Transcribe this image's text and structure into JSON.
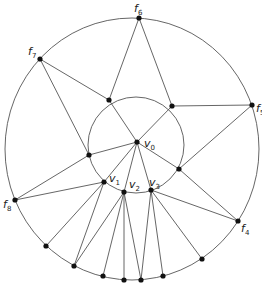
{
  "diagram": {
    "colors": {
      "stroke": "#555555",
      "point": "#111111",
      "background": "#ffffff"
    },
    "outer_circle": {
      "cx": 132,
      "cy": 149,
      "rx": 127,
      "ry": 131
    },
    "inner_circle": {
      "cx": 136,
      "cy": 145,
      "r": 48
    },
    "points": {
      "v0": [
        137,
        142
      ],
      "v1": [
        104,
        182
      ],
      "v2": [
        124,
        192
      ],
      "v3": [
        151,
        190
      ],
      "a1": [
        109,
        100
      ],
      "a2": [
        172,
        106
      ],
      "a3": [
        89,
        155
      ],
      "a4": [
        179,
        169
      ],
      "f4": [
        238,
        221
      ],
      "f5": [
        252,
        105
      ],
      "f6": [
        139,
        18
      ],
      "f7": [
        40,
        59
      ],
      "f8": [
        15,
        200
      ],
      "b1": [
        46,
        246
      ],
      "b2": [
        74,
        266
      ],
      "b3": [
        103,
        276
      ],
      "b4": [
        124,
        280
      ],
      "b5": [
        141,
        280
      ],
      "b6": [
        163,
        276
      ],
      "b7": [
        202,
        259
      ]
    },
    "edges": [
      [
        "f6",
        "a1"
      ],
      [
        "f6",
        "a2"
      ],
      [
        "f7",
        "a1"
      ],
      [
        "f7",
        "a3"
      ],
      [
        "a1",
        "v0"
      ],
      [
        "a2",
        "v0"
      ],
      [
        "a2",
        "f5"
      ],
      [
        "f5",
        "a4"
      ],
      [
        "a4",
        "v0"
      ],
      [
        "a4",
        "f4"
      ],
      [
        "a3",
        "v0"
      ],
      [
        "a3",
        "f8"
      ],
      [
        "v0",
        "v1"
      ],
      [
        "v0",
        "v2"
      ],
      [
        "v0",
        "v3"
      ],
      [
        "f8",
        "v1"
      ],
      [
        "v1",
        "b1"
      ],
      [
        "v1",
        "b2"
      ],
      [
        "v2",
        "b2"
      ],
      [
        "v2",
        "b3"
      ],
      [
        "v2",
        "b4"
      ],
      [
        "v2",
        "b5"
      ],
      [
        "v3",
        "b5"
      ],
      [
        "v3",
        "b6"
      ],
      [
        "v3",
        "b7"
      ],
      [
        "v3",
        "f4"
      ]
    ],
    "labels": [
      {
        "id": "f6",
        "text": "f",
        "sub": "6",
        "x": 134,
        "y": 12
      },
      {
        "id": "f7",
        "text": "f",
        "sub": "7",
        "x": 28,
        "y": 55
      },
      {
        "id": "f5",
        "text": "f",
        "sub": "5",
        "x": 256,
        "y": 112
      },
      {
        "id": "f8",
        "text": "f",
        "sub": "8",
        "x": 3,
        "y": 208
      },
      {
        "id": "f4",
        "text": "f",
        "sub": "4",
        "x": 241,
        "y": 232
      },
      {
        "id": "v0",
        "text": "v",
        "sub": "0",
        "x": 144,
        "y": 147
      },
      {
        "id": "v1",
        "text": "v",
        "sub": "1",
        "x": 109,
        "y": 182
      },
      {
        "id": "v2",
        "text": "v",
        "sub": "2",
        "x": 129,
        "y": 188
      },
      {
        "id": "v3",
        "text": "v",
        "sub": "3",
        "x": 149,
        "y": 186
      }
    ]
  }
}
